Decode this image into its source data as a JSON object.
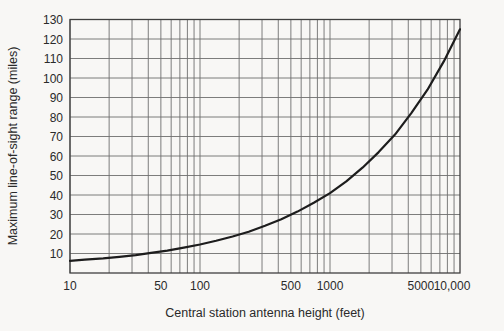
{
  "page": {
    "background_color": "#f8f7f5"
  },
  "chart_data": {
    "type": "line",
    "title": "",
    "xlabel": "Central station antenna height (feet)",
    "ylabel": "Maximum line-of-sight range (miles)",
    "x_scale": "log",
    "xlim": [
      10,
      10000
    ],
    "ylim": [
      0,
      130
    ],
    "grid": "on: logarithmic minor vertical lines (2-9 each decade), horizontal lines every 10 miles",
    "legend": "none",
    "x_ticks": [
      {
        "value": 10,
        "label": "10"
      },
      {
        "value": 50,
        "label": "50"
      },
      {
        "value": 100,
        "label": "100"
      },
      {
        "value": 500,
        "label": "500"
      },
      {
        "value": 1000,
        "label": "1000"
      },
      {
        "value": 5000,
        "label": "5000"
      },
      {
        "value": 10000,
        "label": "10,000"
      }
    ],
    "y_ticks": [
      {
        "value": 10,
        "label": "10"
      },
      {
        "value": 20,
        "label": "20"
      },
      {
        "value": 30,
        "label": "30"
      },
      {
        "value": 40,
        "label": "40"
      },
      {
        "value": 50,
        "label": "50"
      },
      {
        "value": 60,
        "label": "60"
      },
      {
        "value": 70,
        "label": "70"
      },
      {
        "value": 80,
        "label": "80"
      },
      {
        "value": 90,
        "label": "90"
      },
      {
        "value": 100,
        "label": "100"
      },
      {
        "value": 110,
        "label": "110"
      },
      {
        "value": 120,
        "label": "120"
      },
      {
        "value": 130,
        "label": "130"
      }
    ],
    "series": [
      {
        "name": "maximum line-of-sight range",
        "color": "#1d1d1d",
        "points": [
          [
            10,
            6.2
          ],
          [
            13,
            6.8
          ],
          [
            18,
            7.5
          ],
          [
            24,
            8.3
          ],
          [
            32,
            9.2
          ],
          [
            42,
            10.3
          ],
          [
            56,
            11.5
          ],
          [
            75,
            13.0
          ],
          [
            100,
            14.6
          ],
          [
            133,
            16.5
          ],
          [
            178,
            18.7
          ],
          [
            237,
            21.2
          ],
          [
            316,
            24.2
          ],
          [
            422,
            27.6
          ],
          [
            562,
            31.5
          ],
          [
            750,
            36.0
          ],
          [
            1000,
            41.0
          ],
          [
            1334,
            47.0
          ],
          [
            1778,
            54.0
          ],
          [
            2371,
            62.0
          ],
          [
            3162,
            71.0
          ],
          [
            4217,
            82.0
          ],
          [
            5623,
            94.0
          ],
          [
            7500,
            108.5
          ],
          [
            10000,
            125.0
          ]
        ]
      }
    ],
    "colors": {
      "grid": "#6e6e6e",
      "frame": "#3f3f3f",
      "curve": "#1d1d1d",
      "text": "#2a2a2a",
      "background": "#f8f7f5"
    }
  }
}
